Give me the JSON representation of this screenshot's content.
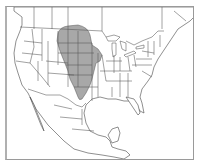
{
  "map": {
    "region": "North America",
    "type": "species range map",
    "shaded_region": "Great Plains (central United States to southern Canada)",
    "colors": {
      "range_fill": "#a8a8a8",
      "background": "#ffffff",
      "border_lines": "#555555",
      "frame": "#9a9a9a"
    }
  }
}
